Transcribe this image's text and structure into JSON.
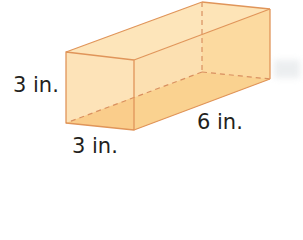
{
  "figure": {
    "type": "rectangular prism",
    "colors": {
      "face_light": "#fde3b3",
      "face_base": "#f9c983",
      "edge": "#e0955a",
      "hidden_edge": "#d99060"
    },
    "labels": {
      "height": "3 in.",
      "width": "3 in.",
      "length": "6 in."
    }
  }
}
